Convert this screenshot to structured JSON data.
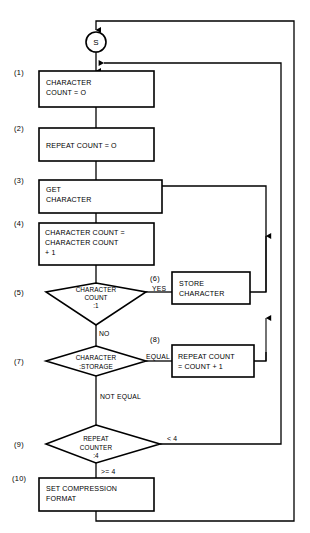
{
  "diagram": {
    "start": {
      "label": "S",
      "name": "start-node"
    },
    "steps": [
      {
        "number": "(1)",
        "shape": "process",
        "lines": [
          "CHARACTER",
          "COUNT = O"
        ]
      },
      {
        "number": "(2)",
        "shape": "process",
        "lines": [
          "REPEAT COUNT = O"
        ]
      },
      {
        "number": "(3)",
        "shape": "process",
        "lines": [
          "GET",
          "CHARACTER"
        ]
      },
      {
        "number": "(4)",
        "shape": "process",
        "lines": [
          "CHARACTER COUNT =",
          "CHARACTER COUNT",
          "+ 1"
        ]
      },
      {
        "number": "(5)",
        "shape": "decision",
        "lines": [
          "CHARACTER",
          "COUNT",
          ":1"
        ]
      },
      {
        "number": "(6)",
        "shape": "process",
        "lines": [
          "STORE",
          "CHARACTER"
        ]
      },
      {
        "number": "(7)",
        "shape": "decision",
        "lines": [
          "CHARACTER",
          ":STORAGE"
        ]
      },
      {
        "number": "(8)",
        "shape": "process",
        "lines": [
          "REPEAT COUNT",
          "= COUNT + 1"
        ]
      },
      {
        "number": "(9)",
        "shape": "decision",
        "lines": [
          "REPEAT",
          "COUNTER",
          ":4"
        ]
      },
      {
        "number": "(10)",
        "shape": "process",
        "lines": [
          "SET COMPRESSION",
          "FORMAT"
        ]
      }
    ],
    "edge_labels": {
      "yes": "YES",
      "no": "NO",
      "equal": "EQUAL",
      "not_equal": "NOT EQUAL",
      "less_than_four": "< 4",
      "ge_four": ">= 4"
    },
    "colors": {
      "line": "#000000",
      "fill": "#ffffff",
      "text": "#000000"
    }
  }
}
